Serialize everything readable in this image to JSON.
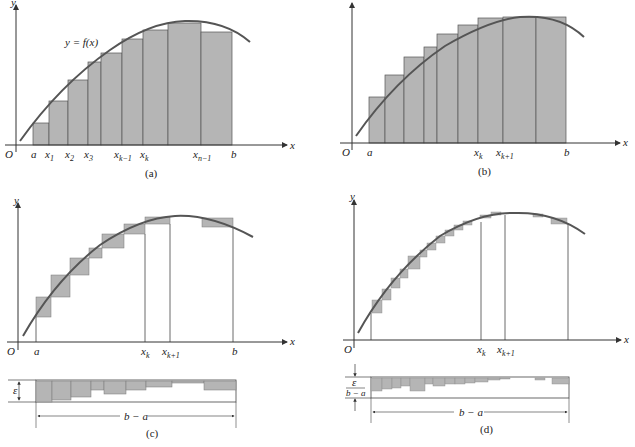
{
  "colors": {
    "fill": "#b5b5b5",
    "curve": "#555555",
    "axis": "#333333",
    "line": "#444444"
  },
  "axes": {
    "x_label": "x",
    "y_label": "y",
    "origin_label": "O"
  },
  "panels": {
    "a": {
      "caption": "(a)",
      "curve_label": "y = f(x)",
      "tick_labels": [
        "a",
        "x1",
        "x2",
        "x3",
        "xk−1",
        "xk",
        "xn−1",
        "b"
      ],
      "description": "Lower sum: rectangles inscribed under the curve"
    },
    "b": {
      "caption": "(b)",
      "tick_labels": [
        "a",
        "xk",
        "xk+1",
        "b"
      ],
      "description": "Upper sum: rectangles circumscribed over the curve"
    },
    "c": {
      "caption": "(c)",
      "tick_labels": [
        "a",
        "xk",
        "xk+1",
        "b"
      ],
      "strip_height_label": "ε",
      "strip_width_label": "b − a",
      "description": "Difference between upper and lower sums, stacked into a strip"
    },
    "d": {
      "caption": "(d)",
      "tick_labels": [
        "a",
        "xk",
        "xk+1",
        "b"
      ],
      "strip_height_label_num": "ε",
      "strip_height_label_den": "b − a",
      "strip_width_label": "b − a",
      "description": "Finer partition: difference strip height ε/(b − a)"
    }
  }
}
